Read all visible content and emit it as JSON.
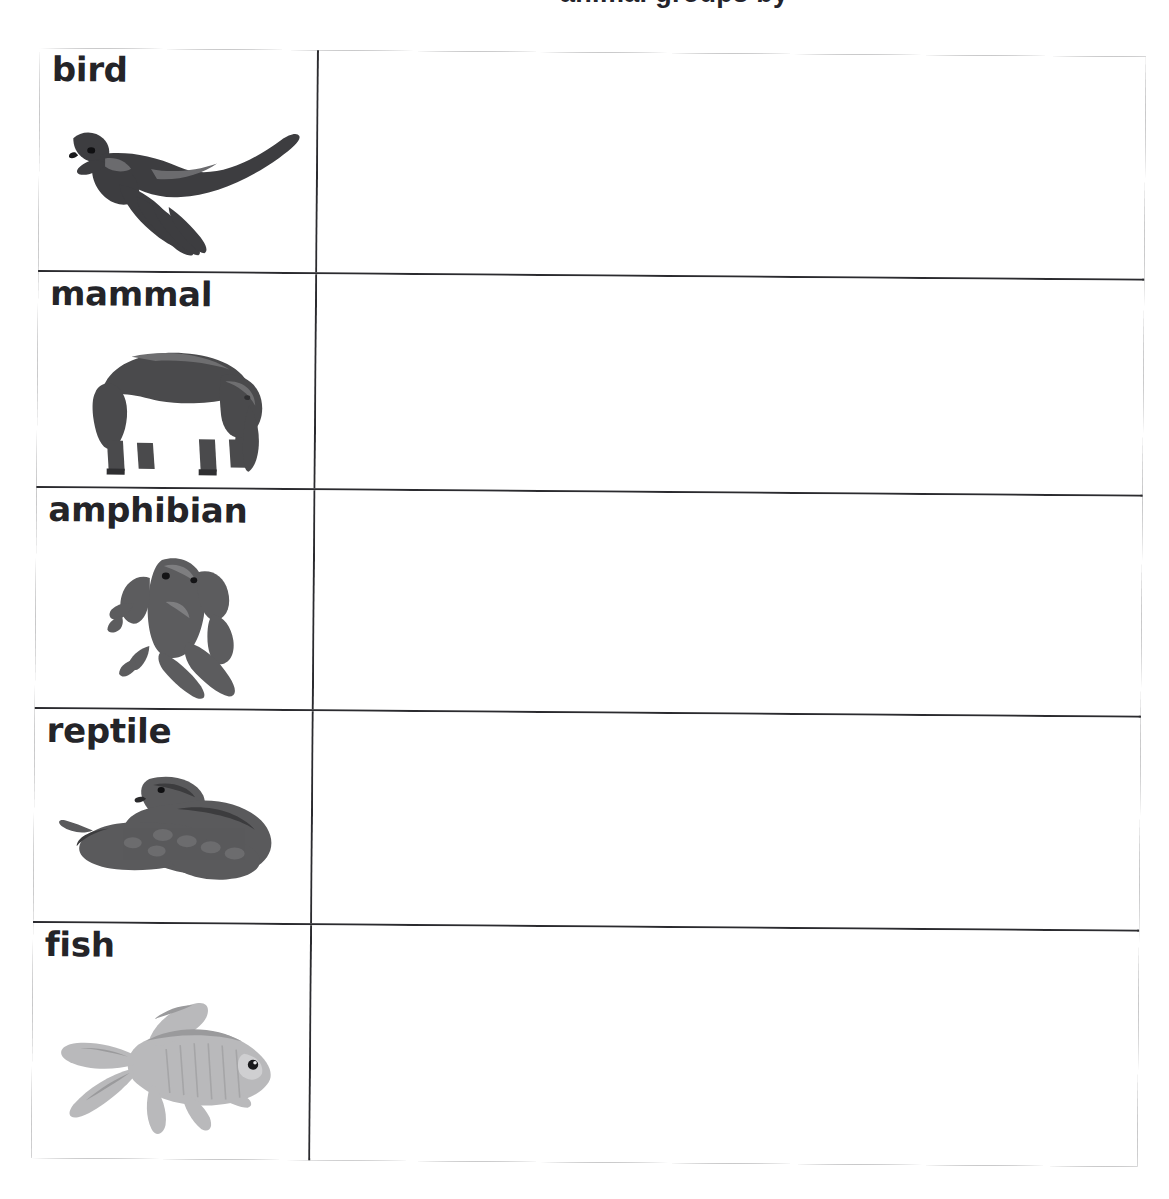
{
  "document": {
    "title": "Animal classification worksheet",
    "header_fragment": "animal groups by",
    "page_background": "#ffffff",
    "ink_color": "#2b2b2f",
    "label_color": "#242428"
  },
  "table": {
    "column_count": 2,
    "row_count": 5,
    "columns": [
      {
        "name": "animal-group",
        "header": ""
      },
      {
        "name": "answer-space",
        "header": ""
      }
    ],
    "rows": [
      {
        "label": "bird",
        "image_name": "falcon-photo",
        "image_description": "grayscale photo of a falcon in flight with spread wings",
        "answer": ""
      },
      {
        "label": "mammal",
        "image_name": "elephant-photo",
        "image_description": "grayscale photo of an elephant standing in profile",
        "answer": ""
      },
      {
        "label": "amphibian",
        "image_name": "frog-photo",
        "image_description": "grayscale photo of a tree frog viewed from above",
        "answer": ""
      },
      {
        "label": "reptile",
        "image_name": "snake-photo",
        "image_description": "grayscale photo of a coiled snake",
        "answer": ""
      },
      {
        "label": "fish",
        "image_name": "goldfish-photo",
        "image_description": "grayscale photo of a goldfish with flowing fins",
        "answer": ""
      }
    ]
  }
}
